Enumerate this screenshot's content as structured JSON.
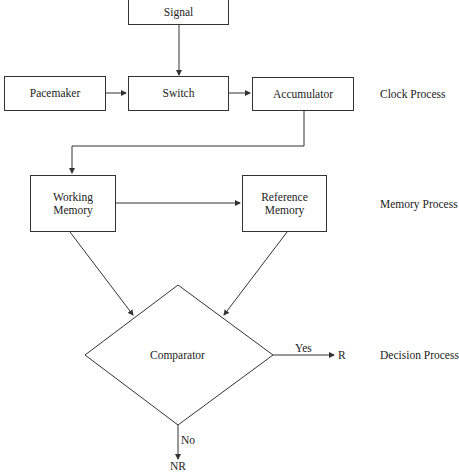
{
  "nodes": {
    "signal": "Signal",
    "pacemaker": "Pacemaker",
    "switch": "Switch",
    "accumulator": "Accumulator",
    "working_memory": "Working Memory",
    "reference_memory": "Reference Memory",
    "comparator": "Comparator"
  },
  "edges": {
    "yes": "Yes",
    "no": "No"
  },
  "outputs": {
    "r": "R",
    "nr": "NR"
  },
  "process_labels": {
    "clock": "Clock Process",
    "memory": "Memory Process",
    "decision": "Decision Process"
  }
}
